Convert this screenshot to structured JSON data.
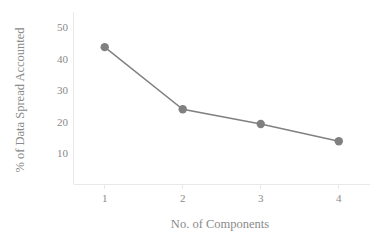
{
  "chart_data": {
    "type": "line",
    "title": "",
    "subtitle": "",
    "xlabel": "No. of Components",
    "ylabel": "% of Data Spread Accounted",
    "categories": [
      "1",
      "2",
      "3",
      "4"
    ],
    "x": [
      1,
      2,
      3,
      4
    ],
    "values": [
      43.8,
      24.0,
      19.3,
      13.8
    ],
    "series": [
      {
        "name": "% of Data Spread Accounted",
        "values": [
          43.8,
          24.0,
          19.3,
          13.8
        ]
      }
    ],
    "xlim": [
      0.6,
      4.4
    ],
    "ylim": [
      0,
      55
    ],
    "x_tick_labels": [
      "1",
      "2",
      "3",
      "4"
    ],
    "y_tick_labels": [
      "10",
      "20",
      "30",
      "40",
      "50"
    ],
    "y_ticks": [
      10,
      20,
      30,
      40,
      50
    ],
    "grid": false,
    "legend": false,
    "legend_position": "none",
    "marker": "circle",
    "marker_color": "#808080",
    "line_color": "#808080",
    "axis_color": "#e8e8e8",
    "text_color": "#8a8a8a",
    "background_color": "#ffffff"
  },
  "axes": {
    "y_title": "% of Data Spread Accounted",
    "x_title": "No. of Components",
    "y_tick_1": "10",
    "y_tick_2": "20",
    "y_tick_3": "30",
    "y_tick_4": "40",
    "y_tick_5": "50",
    "x_tick_1": "1",
    "x_tick_2": "2",
    "x_tick_3": "3",
    "x_tick_4": "4"
  }
}
